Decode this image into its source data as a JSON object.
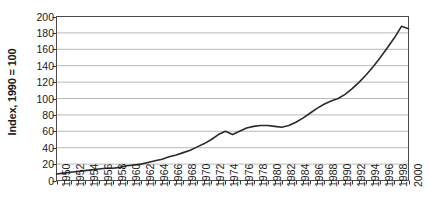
{
  "chart_data": {
    "type": "line",
    "title": "",
    "xlabel": "",
    "ylabel": "Index, 1990 = 100",
    "xlim": [
      1950,
      2000
    ],
    "ylim": [
      0,
      200
    ],
    "ytick_step": 20,
    "xtick_step_labeled": 2,
    "xtick_step_minor": 1,
    "grid": "horizontal",
    "legend": "none",
    "yticks": [
      0,
      20,
      40,
      60,
      80,
      100,
      120,
      140,
      160,
      180,
      200
    ],
    "ytick_labels": [
      "0",
      "20",
      "40",
      "60",
      "80",
      "100",
      "120",
      "140",
      "160",
      "180",
      "200"
    ],
    "xticks": [
      1950,
      1952,
      1954,
      1956,
      1958,
      1960,
      1962,
      1964,
      1966,
      1968,
      1970,
      1972,
      1974,
      1976,
      1978,
      1980,
      1982,
      1984,
      1986,
      1988,
      1990,
      1992,
      1994,
      1996,
      1998,
      2000
    ],
    "xtick_labels": [
      "1950",
      "1952",
      "1954",
      "1956",
      "1958",
      "1960",
      "1962",
      "1964",
      "1966",
      "1968",
      "1970",
      "1972",
      "1974",
      "1976",
      "1978",
      "1980",
      "1982",
      "1984",
      "1986",
      "1988",
      "1990",
      "1992",
      "1994",
      "1996",
      "1998",
      "2000"
    ],
    "series": [
      {
        "name": "Index",
        "color": "#2b2b2b",
        "x": [
          1950,
          1951,
          1952,
          1953,
          1954,
          1955,
          1956,
          1957,
          1958,
          1959,
          1960,
          1961,
          1962,
          1963,
          1964,
          1965,
          1966,
          1967,
          1968,
          1969,
          1970,
          1971,
          1972,
          1973,
          1974,
          1975,
          1976,
          1977,
          1978,
          1979,
          1980,
          1981,
          1982,
          1983,
          1984,
          1985,
          1986,
          1987,
          1988,
          1989,
          1990,
          1991,
          1992,
          1993,
          1994,
          1995,
          1996,
          1997,
          1998,
          1999,
          2000
        ],
        "y": [
          8,
          9,
          10,
          11,
          12,
          13,
          14,
          15,
          15,
          16,
          18,
          19,
          20,
          22,
          24,
          26,
          29,
          31,
          34,
          37,
          41,
          45,
          50,
          56,
          60,
          56,
          60,
          64,
          66,
          67,
          67,
          66,
          65,
          67,
          71,
          76,
          82,
          88,
          93,
          97,
          100,
          105,
          112,
          120,
          129,
          139,
          150,
          162,
          174,
          188,
          185
        ]
      }
    ]
  }
}
